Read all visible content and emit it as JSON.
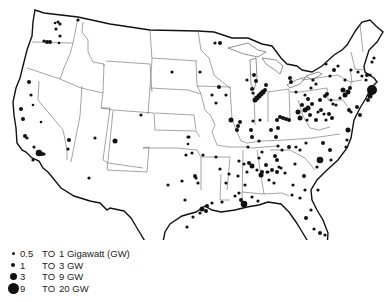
{
  "map": {
    "title": "Electric power generating plants, contiguous United States",
    "outline_color": "#111111",
    "state_line_color": "#555555",
    "dot_color": "#111111"
  },
  "legend": {
    "items": [
      {
        "size_class": "xs",
        "low": "0.5",
        "to": "TO",
        "high": "1 Gigawatt (GW)",
        "radius": 1.3
      },
      {
        "size_class": "s",
        "low": "1",
        "to": "TO",
        "high": "3 GW",
        "radius": 2.0
      },
      {
        "size_class": "m",
        "low": "3",
        "to": "TO",
        "high": "9 GW",
        "radius": 3.3
      },
      {
        "size_class": "l",
        "low": "9",
        "to": "TO",
        "high": "20 GW",
        "radius": 5.0
      }
    ]
  },
  "plants": [
    [
      58,
      22,
      1.6
    ],
    [
      60,
      24,
      1.6
    ],
    [
      55,
      23,
      1.3
    ],
    [
      56,
      29,
      1.6
    ],
    [
      60,
      36,
      1.6
    ],
    [
      44,
      41,
      1.6
    ],
    [
      47,
      42,
      2
    ],
    [
      50,
      42,
      2
    ],
    [
      59,
      43,
      1.3
    ],
    [
      78,
      20,
      1.6
    ],
    [
      29,
      82,
      2
    ],
    [
      31,
      95,
      1.6
    ],
    [
      33,
      105,
      1.3
    ],
    [
      21,
      109,
      2
    ],
    [
      23,
      119,
      2
    ],
    [
      41,
      122,
      1.3
    ],
    [
      25,
      136,
      2
    ],
    [
      27,
      138,
      1.6
    ],
    [
      34,
      147,
      1.6
    ],
    [
      33,
      160,
      1.6
    ],
    [
      39,
      153,
      3.3
    ],
    [
      42,
      154,
      2
    ],
    [
      44,
      154,
      1.6
    ],
    [
      69,
      140,
      2
    ],
    [
      68,
      149,
      1.6
    ],
    [
      95,
      138,
      1.6
    ],
    [
      115,
      141,
      2.5
    ],
    [
      89,
      178,
      1.6
    ],
    [
      172,
      72,
      1.6
    ],
    [
      141,
      115,
      1.6
    ],
    [
      188,
      137,
      1.6
    ],
    [
      215,
      43,
      1.6
    ],
    [
      220,
      43,
      2
    ],
    [
      200,
      72,
      1.6
    ],
    [
      212,
      95,
      1.6
    ],
    [
      216,
      103,
      1.6
    ],
    [
      189,
      137,
      1.6
    ],
    [
      188,
      144,
      1.3
    ],
    [
      219,
      87,
      2
    ],
    [
      226,
      95,
      1.6
    ],
    [
      231,
      120,
      2.5
    ],
    [
      237,
      130,
      2
    ],
    [
      238,
      126,
      2
    ],
    [
      240,
      122,
      2
    ],
    [
      254,
      75,
      2
    ],
    [
      256,
      81,
      2
    ],
    [
      253,
      93,
      1.6
    ],
    [
      255,
      100,
      2.5
    ],
    [
      257,
      98,
      2.5
    ],
    [
      259,
      96,
      2.5
    ],
    [
      261,
      94,
      2.5
    ],
    [
      263,
      92,
      2.5
    ],
    [
      265,
      90,
      2
    ],
    [
      252,
      89,
      2
    ],
    [
      247,
      80,
      1.6
    ],
    [
      266,
      85,
      2
    ],
    [
      253,
      121,
      1.6
    ],
    [
      251,
      130,
      2
    ],
    [
      252,
      137,
      2
    ],
    [
      248,
      147,
      1.6
    ],
    [
      259,
      141,
      1.6
    ],
    [
      260,
      120,
      1.6
    ],
    [
      277,
      120,
      2
    ],
    [
      280,
      117,
      2
    ],
    [
      283,
      118,
      2
    ],
    [
      286,
      119,
      2
    ],
    [
      289,
      120,
      2
    ],
    [
      278,
      128,
      2
    ],
    [
      271,
      130,
      2
    ],
    [
      276,
      137,
      2
    ],
    [
      278,
      146,
      1.6
    ],
    [
      290,
      78,
      2
    ],
    [
      291,
      82,
      2
    ],
    [
      296,
      92,
      1.6
    ],
    [
      305,
      95,
      1.6
    ],
    [
      308,
      99,
      2
    ],
    [
      311,
      88,
      1.6
    ],
    [
      313,
      80,
      1.6
    ],
    [
      316,
      84,
      1.6
    ],
    [
      302,
      105,
      2
    ],
    [
      305,
      110,
      2.5
    ],
    [
      308,
      108,
      2.5
    ],
    [
      312,
      104,
      2
    ],
    [
      310,
      115,
      2
    ],
    [
      298,
      112,
      2.5
    ],
    [
      300,
      118,
      2.5
    ],
    [
      307,
      120,
      1.6
    ],
    [
      316,
      120,
      2
    ],
    [
      318,
      112,
      1.6
    ],
    [
      320,
      100,
      2
    ],
    [
      325,
      96,
      2
    ],
    [
      327,
      94,
      2
    ],
    [
      321,
      110,
      2
    ],
    [
      324,
      114,
      1.6
    ],
    [
      331,
      100,
      1.6
    ],
    [
      329,
      114,
      2
    ],
    [
      332,
      118,
      2
    ],
    [
      326,
      120,
      1.6
    ],
    [
      333,
      104,
      1.6
    ],
    [
      336,
      105,
      1.6
    ],
    [
      343,
      90,
      2.5
    ],
    [
      345,
      95,
      2.5
    ],
    [
      348,
      92,
      2.5
    ],
    [
      350,
      88,
      2
    ],
    [
      345,
      80,
      1.6
    ],
    [
      349,
      110,
      2
    ],
    [
      351,
      112,
      1.6
    ],
    [
      351,
      70,
      1.6
    ],
    [
      358,
      72,
      1.6
    ],
    [
      362,
      76,
      1.6
    ],
    [
      366,
      80,
      1.6
    ],
    [
      367,
      75,
      2
    ],
    [
      370,
      75,
      1.6
    ],
    [
      372,
      62,
      1.6
    ],
    [
      374,
      58,
      1.6
    ],
    [
      372,
      90,
      5
    ],
    [
      370,
      96,
      2.5
    ],
    [
      368,
      100,
      2
    ],
    [
      357,
      107,
      2
    ],
    [
      360,
      115,
      2
    ],
    [
      348,
      130,
      2.5
    ],
    [
      347,
      140,
      1.6
    ],
    [
      346,
      147,
      1.6
    ],
    [
      340,
      98,
      1.6
    ],
    [
      338,
      66,
      1.6
    ],
    [
      334,
      70,
      2
    ],
    [
      330,
      76,
      1.6
    ],
    [
      326,
      64,
      1.6
    ],
    [
      330,
      150,
      2
    ],
    [
      323,
      143,
      2
    ],
    [
      320,
      160,
      3.3
    ],
    [
      331,
      160,
      1.6
    ],
    [
      317,
      167,
      1.6
    ],
    [
      306,
      143,
      1.6
    ],
    [
      300,
      150,
      1.6
    ],
    [
      296,
      147,
      1.6
    ],
    [
      289,
      147,
      2
    ],
    [
      282,
      150,
      1.6
    ],
    [
      275,
      156,
      2
    ],
    [
      277,
      160,
      2
    ],
    [
      279,
      167,
      1.6
    ],
    [
      262,
      152,
      1.6
    ],
    [
      259,
      158,
      1.6
    ],
    [
      266,
      165,
      2
    ],
    [
      272,
      170,
      2
    ],
    [
      268,
      172,
      1.6
    ],
    [
      262,
      172,
      2
    ],
    [
      257,
      170,
      1.6
    ],
    [
      261,
      175,
      2.5
    ],
    [
      269,
      180,
      1.6
    ],
    [
      277,
      172,
      2
    ],
    [
      285,
      173,
      1.6
    ],
    [
      295,
      164,
      1.6
    ],
    [
      304,
      176,
      2
    ],
    [
      293,
      185,
      1.6
    ],
    [
      292,
      195,
      1.6
    ],
    [
      300,
      198,
      1.6
    ],
    [
      305,
      190,
      1.6
    ],
    [
      203,
      155,
      1.6
    ],
    [
      216,
      157,
      1.6
    ],
    [
      220,
      169,
      1.6
    ],
    [
      226,
      183,
      1.6
    ],
    [
      229,
      174,
      1.6
    ],
    [
      244,
      164,
      1.6
    ],
    [
      239,
      161,
      1.6
    ],
    [
      249,
      163,
      2
    ],
    [
      252,
      166,
      2.5
    ],
    [
      247,
      172,
      1.6
    ],
    [
      238,
      176,
      1.6
    ],
    [
      245,
      185,
      1.6
    ],
    [
      239,
      193,
      1.6
    ],
    [
      244,
      204,
      3.3
    ],
    [
      241,
      200,
      2
    ],
    [
      252,
      197,
      1.6
    ],
    [
      258,
      201,
      1.6
    ],
    [
      267,
      172,
      1.6
    ],
    [
      274,
      183,
      1.6
    ],
    [
      281,
      168,
      1.6
    ],
    [
      186,
      155,
      1.6
    ],
    [
      192,
      153,
      1.6
    ],
    [
      198,
      183,
      1.6
    ],
    [
      196,
      178,
      1.6
    ],
    [
      195,
      176,
      2
    ],
    [
      168,
      185,
      1.6
    ],
    [
      182,
      181,
      1.6
    ],
    [
      185,
      200,
      1.6
    ],
    [
      202,
      209,
      2.5
    ],
    [
      206,
      211,
      2
    ],
    [
      207,
      206,
      2
    ],
    [
      212,
      203,
      1.6
    ],
    [
      200,
      213,
      1.6
    ],
    [
      193,
      217,
      1.6
    ],
    [
      187,
      227,
      1.6
    ],
    [
      222,
      202,
      1.6
    ],
    [
      235,
      196,
      1.6
    ],
    [
      318,
      190,
      1.6
    ],
    [
      311,
      210,
      1.6
    ],
    [
      306,
      218,
      2
    ],
    [
      314,
      229,
      1.6
    ],
    [
      320,
      233,
      2
    ],
    [
      325,
      235,
      1.6
    ]
  ]
}
